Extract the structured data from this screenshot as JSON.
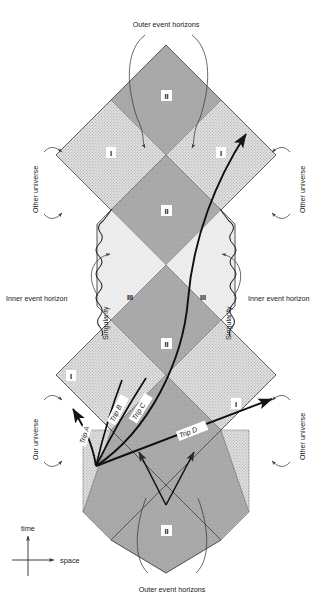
{
  "figure": {
    "type": "penrose-diagram",
    "background_color": "#ffffff",
    "region_fill_I": "#d9d9d9",
    "region_fill_II": "#a8a8a8",
    "region_fill_III": "#ededed",
    "line_color": "#1a1a1a"
  },
  "labels": {
    "outer_event_horizons_top": "Outer event horizons",
    "outer_event_horizons_bottom": "Outer event horizons",
    "inner_event_horizon_left": "Inner event horizon",
    "inner_event_horizon_right": "Inner event horizon",
    "singularity_left": "Singularity",
    "singularity_right": "Singularity",
    "other_universe_top_left": "Other universe",
    "other_universe_top_right": "Other universe",
    "our_universe_bottom_left": "Our universe",
    "other_universe_bottom_right": "Other universe"
  },
  "regions": [
    {
      "id": "region-II-top",
      "label": "II",
      "shade": "dark"
    },
    {
      "id": "region-I-upper-left",
      "label": "I",
      "shade": "stipple"
    },
    {
      "id": "region-I-upper-right",
      "label": "I",
      "shade": "stipple"
    },
    {
      "id": "region-II-upper-mid",
      "label": "II",
      "shade": "dark"
    },
    {
      "id": "region-III-left",
      "label": "III",
      "shade": "light"
    },
    {
      "id": "region-III-right",
      "label": "III",
      "shade": "light"
    },
    {
      "id": "region-II-lower-mid",
      "label": "II",
      "shade": "dark"
    },
    {
      "id": "region-I-lower-left",
      "label": "I",
      "shade": "stipple"
    },
    {
      "id": "region-I-lower-right",
      "label": "I",
      "shade": "stipple"
    },
    {
      "id": "region-II-bottom",
      "label": "II",
      "shade": "dark"
    }
  ],
  "trips": [
    {
      "id": "trip-a",
      "label": "Trip A"
    },
    {
      "id": "trip-b",
      "label": "Trip B"
    },
    {
      "id": "trip-c",
      "label": "Trip C"
    },
    {
      "id": "trip-d",
      "label": "Trip D"
    }
  ],
  "axes": {
    "time_label": "time",
    "space_label": "space"
  }
}
